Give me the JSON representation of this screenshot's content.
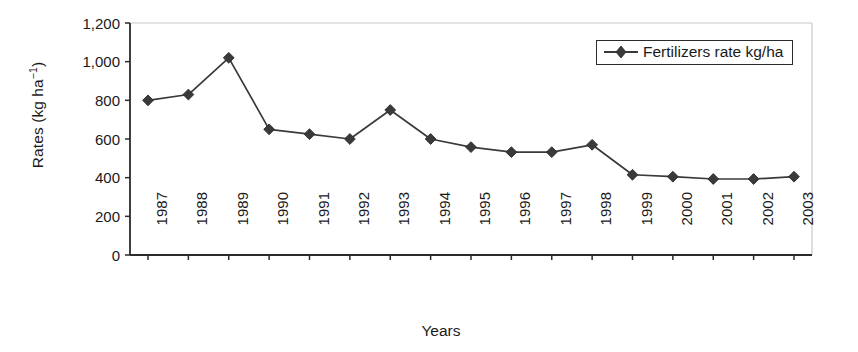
{
  "chart_data": {
    "type": "line",
    "title": "",
    "xlabel": "Years",
    "ylabel": "Rates (kg ha-1)",
    "ylabel_parts": {
      "base": "Rates (kg ha",
      "exponent": "−1",
      "tail": ")"
    },
    "categories": [
      "1987",
      "1988",
      "1989",
      "1990",
      "1991",
      "1992",
      "1993",
      "1994",
      "1995",
      "1996",
      "1997",
      "1998",
      "1999",
      "2000",
      "2001",
      "2002",
      "2003"
    ],
    "x": [
      1987,
      1988,
      1989,
      1990,
      1991,
      1992,
      1993,
      1994,
      1995,
      1996,
      1997,
      1998,
      1999,
      2000,
      2001,
      2002,
      2003
    ],
    "series": [
      {
        "name": "Fertilizers rate kg/ha",
        "values": [
          800,
          830,
          1020,
          650,
          625,
          600,
          750,
          600,
          558,
          532,
          532,
          570,
          415,
          405,
          393,
          393,
          405
        ],
        "marker": "diamond",
        "color": "#3a3a3a"
      }
    ],
    "ylim": [
      0,
      1200
    ],
    "yticks": [
      0,
      200,
      400,
      600,
      800,
      1000,
      1200
    ],
    "ytick_labels": [
      "0",
      "200",
      "400",
      "600",
      "800",
      "1,000",
      "1,200"
    ],
    "grid": false,
    "legend": {
      "position": "top-right",
      "entries": [
        "Fertilizers rate kg/ha"
      ]
    },
    "axis_color": "#2b2b2b",
    "plot_border_color": "#c8c8c8",
    "background": "#ffffff"
  }
}
